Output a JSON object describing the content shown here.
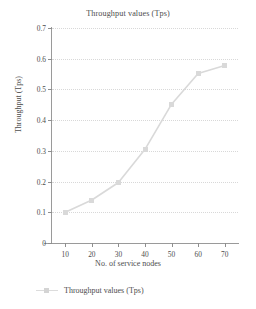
{
  "chart_data": {
    "type": "line",
    "title": "Throughput values (Tps)",
    "xlabel": "No. of service nodes",
    "ylabel": "Throughput (Tps)",
    "x": [
      10,
      20,
      30,
      40,
      50,
      60,
      70
    ],
    "values": [
      0.1,
      0.14,
      0.197,
      0.305,
      0.452,
      0.552,
      0.578
    ],
    "series": [
      {
        "name": "Throughput values (Tps)",
        "values": [
          0.1,
          0.14,
          0.197,
          0.305,
          0.452,
          0.552,
          0.578
        ]
      }
    ],
    "xlim": [
      5,
      75
    ],
    "ylim": [
      0,
      0.7
    ],
    "xticks": [
      "10",
      "20",
      "30",
      "40",
      "50",
      "60",
      "70"
    ],
    "yticks": [
      "0",
      "0.1",
      "0.2",
      "0.3",
      "0.4",
      "0.5",
      "0.6",
      "0.7"
    ],
    "grid": "horizontal-dotted",
    "legend_position": "bottom-left",
    "marker": "square",
    "series_color": "#d9d9d9",
    "grid_color": "#d8d8d8",
    "axis_color": "#9a9a9a",
    "text_color": "#4d4d4d"
  },
  "legend": {
    "entries": [
      {
        "label": "Throughput values (Tps)",
        "marker": "square-marker"
      }
    ]
  }
}
